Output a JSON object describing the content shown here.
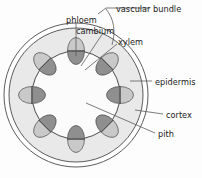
{
  "diagram": {
    "background": "#fdfdfd",
    "frame_color": "#f2f2f2"
  },
  "colors": {
    "outline": "#4a4a4a",
    "leader": "#5a5a5a",
    "cortex_fill": "#e9e9e9",
    "pith_fill": "#fbfbfb",
    "phloem_fill": "#c9c9c9",
    "xylem_fill": "#8f8f8f",
    "cambium_line": "#4a4a4a",
    "text": "#1a1a1a"
  },
  "structure": {
    "epidermis_outer_r": 72,
    "epidermis_inner_r": 67,
    "cortex_outer_r": 67,
    "inner_ring_r": 44,
    "center_x": 76,
    "center_y": 95,
    "bundle_count": 8,
    "bundle_rx": 8.5,
    "bundle_ry": 13.5
  },
  "labels": [
    {
      "id": "vascular-bundle",
      "text": "vascular bundle",
      "x": 116,
      "y": 9,
      "anchor": "start"
    },
    {
      "id": "phloem",
      "text": "phloem",
      "x": 66,
      "y": 20,
      "anchor": "start"
    },
    {
      "id": "cambium",
      "text": "cambium",
      "x": 76,
      "y": 31,
      "anchor": "start"
    },
    {
      "id": "xylem",
      "text": "xylem",
      "x": 118,
      "y": 42,
      "anchor": "start"
    },
    {
      "id": "epidermis",
      "text": "epidermis",
      "x": 155,
      "y": 83,
      "anchor": "start"
    },
    {
      "id": "cortex",
      "text": "cortex",
      "x": 166,
      "y": 116,
      "anchor": "start"
    },
    {
      "id": "pith",
      "text": "pith",
      "x": 158,
      "y": 136,
      "anchor": "start"
    }
  ],
  "leaders": {
    "vascular_bundle_brace": "M 98 14 L 106 8 L 150 8",
    "vascular_bundle_hook": "M 106 8 C 114 18, 116 30, 112 44",
    "phloem_line": "M 76 22 L 76 56",
    "cambium_line": "M 102 33 L 80 66",
    "xylem_line": "M 116 44 L 84 70",
    "epidermis_line": "M 152 82 L 131 82",
    "cortex_line": "M 163 115 L 136 110",
    "pith_line": "M 155 134 L 86 103"
  }
}
